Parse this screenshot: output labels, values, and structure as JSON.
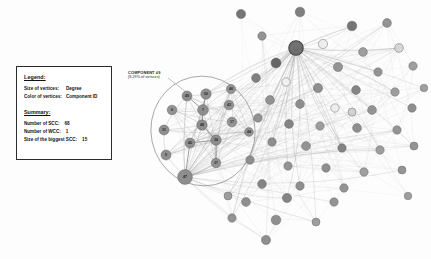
{
  "background": "#fdfdfd",
  "legend": {
    "title": "Legend:",
    "rows": [
      {
        "label": "Size of vertices:",
        "value": "Degree"
      },
      {
        "label": "Color of vertices:",
        "value": "Component ID"
      }
    ],
    "summary_title": "Summary:",
    "summary_rows": [
      {
        "label": "Number of SCC:",
        "value": "68"
      },
      {
        "label": "Number of WCC:",
        "value": "1"
      },
      {
        "label": "Size of the biggest SCC:",
        "value": "15"
      }
    ]
  },
  "annotation": {
    "title": "COMPONENT #9",
    "subtitle": "(8.29% of vertices)"
  },
  "colors": {
    "node_dark": "#6f6f6f",
    "node_mid": "#8f8f8f",
    "node_light": "#d8d8d8",
    "node_white": "#ffffff",
    "node_stroke": "#5a5a5a",
    "hub_stroke": "#3a3a3a",
    "edge": "#b9b9b9",
    "edge_strong": "#8a8a8a",
    "ellipse": "#8a8a8a",
    "leader_line": "#9a9a9a",
    "text": "#111111"
  },
  "chart_data": {
    "type": "scatter",
    "xlabel": "",
    "ylabel": "",
    "highlight_ellipse": {
      "cx": 203,
      "cy": 131,
      "rx": 52,
      "ry": 55,
      "rotation": -12
    },
    "leader_line": {
      "x1": 168,
      "y1": 78,
      "x2": 186,
      "y2": 92
    },
    "labeled_nodes": [
      {
        "id": "49",
        "x": 187,
        "y": 96,
        "r": 5.0,
        "color": "#8a8a8a"
      },
      {
        "id": "50",
        "x": 206,
        "y": 94,
        "r": 5.2,
        "color": "#8a8a8a"
      },
      {
        "id": "46",
        "x": 231,
        "y": 89,
        "r": 4.6,
        "color": "#8f8f8f"
      },
      {
        "id": "6",
        "x": 172,
        "y": 110,
        "r": 4.8,
        "color": "#8f8f8f"
      },
      {
        "id": "7",
        "x": 203,
        "y": 110,
        "r": 5.4,
        "color": "#8a8a8a"
      },
      {
        "id": "43",
        "x": 229,
        "y": 105,
        "r": 4.8,
        "color": "#8f8f8f"
      },
      {
        "id": "48",
        "x": 202,
        "y": 125,
        "r": 5.2,
        "color": "#8a8a8a"
      },
      {
        "id": "17",
        "x": 232,
        "y": 122,
        "r": 4.8,
        "color": "#8f8f8f"
      },
      {
        "id": "31",
        "x": 164,
        "y": 130,
        "r": 5.0,
        "color": "#8a8a8a"
      },
      {
        "id": "44",
        "x": 249,
        "y": 132,
        "r": 4.4,
        "color": "#8f8f8f"
      },
      {
        "id": "40",
        "x": 190,
        "y": 143,
        "r": 5.0,
        "color": "#8a8a8a"
      },
      {
        "id": "34",
        "x": 216,
        "y": 140,
        "r": 5.2,
        "color": "#8a8a8a"
      },
      {
        "id": "5",
        "x": 166,
        "y": 155,
        "r": 5.0,
        "color": "#8a8a8a"
      },
      {
        "id": "37",
        "x": 216,
        "y": 163,
        "r": 4.8,
        "color": "#8f8f8f"
      },
      {
        "id": "47",
        "x": 185,
        "y": 177,
        "r": 7.4,
        "color": "#8a8a8a"
      }
    ],
    "scatter_nodes": [
      {
        "x": 241,
        "y": 14,
        "r": 4.6,
        "color": "#6f6f6f"
      },
      {
        "x": 300,
        "y": 12,
        "r": 4.8,
        "color": "#7a7a7a"
      },
      {
        "x": 352,
        "y": 26,
        "r": 4.8,
        "color": "#6f6f6f"
      },
      {
        "x": 387,
        "y": 23,
        "r": 4.4,
        "color": "#8f8f8f"
      },
      {
        "x": 262,
        "y": 36,
        "r": 4.2,
        "color": "#8f8f8f"
      },
      {
        "x": 296,
        "y": 48,
        "r": 7.2,
        "color": "#6a6a6a"
      },
      {
        "x": 323,
        "y": 44,
        "r": 4.6,
        "color": "#ededed"
      },
      {
        "x": 363,
        "y": 52,
        "r": 4.4,
        "color": "#9a9a9a"
      },
      {
        "x": 399,
        "y": 48,
        "r": 4.4,
        "color": "#d6d6d6"
      },
      {
        "x": 276,
        "y": 63,
        "r": 5.0,
        "color": "#5e5e5e"
      },
      {
        "x": 338,
        "y": 67,
        "r": 4.6,
        "color": "#8f8f8f"
      },
      {
        "x": 378,
        "y": 72,
        "r": 4.2,
        "color": "#8f8f8f"
      },
      {
        "x": 413,
        "y": 66,
        "r": 4.2,
        "color": "#9a9a9a"
      },
      {
        "x": 256,
        "y": 78,
        "r": 4.4,
        "color": "#7a7a7a"
      },
      {
        "x": 286,
        "y": 82,
        "r": 4.2,
        "color": "#f2f2f2"
      },
      {
        "x": 318,
        "y": 88,
        "r": 4.6,
        "color": "#8a8a8a"
      },
      {
        "x": 356,
        "y": 90,
        "r": 4.4,
        "color": "#7f7f7f"
      },
      {
        "x": 395,
        "y": 92,
        "r": 4.2,
        "color": "#9a9a9a"
      },
      {
        "x": 270,
        "y": 100,
        "r": 4.4,
        "color": "#8f8f8f"
      },
      {
        "x": 300,
        "y": 104,
        "r": 4.4,
        "color": "#8a8a8a"
      },
      {
        "x": 335,
        "y": 108,
        "r": 4.2,
        "color": "#ededed"
      },
      {
        "x": 372,
        "y": 110,
        "r": 4.4,
        "color": "#8f8f8f"
      },
      {
        "x": 412,
        "y": 108,
        "r": 4.2,
        "color": "#8a8a8a"
      },
      {
        "x": 258,
        "y": 118,
        "r": 4.2,
        "color": "#8f8f8f"
      },
      {
        "x": 289,
        "y": 124,
        "r": 4.4,
        "color": "#7f7f7f"
      },
      {
        "x": 320,
        "y": 126,
        "r": 4.2,
        "color": "#9a9a9a"
      },
      {
        "x": 357,
        "y": 128,
        "r": 4.4,
        "color": "#8a8a8a"
      },
      {
        "x": 397,
        "y": 130,
        "r": 4.2,
        "color": "#8f8f8f"
      },
      {
        "x": 272,
        "y": 142,
        "r": 4.2,
        "color": "#8a8a8a"
      },
      {
        "x": 306,
        "y": 146,
        "r": 4.4,
        "color": "#8f8f8f"
      },
      {
        "x": 342,
        "y": 148,
        "r": 4.2,
        "color": "#7f7f7f"
      },
      {
        "x": 380,
        "y": 150,
        "r": 4.2,
        "color": "#9a9a9a"
      },
      {
        "x": 414,
        "y": 146,
        "r": 4.0,
        "color": "#8f8f8f"
      },
      {
        "x": 250,
        "y": 160,
        "r": 4.2,
        "color": "#8a8a8a"
      },
      {
        "x": 288,
        "y": 166,
        "r": 4.2,
        "color": "#8f8f8f"
      },
      {
        "x": 326,
        "y": 168,
        "r": 4.2,
        "color": "#8a8a8a"
      },
      {
        "x": 364,
        "y": 172,
        "r": 4.2,
        "color": "#9a9a9a"
      },
      {
        "x": 402,
        "y": 170,
        "r": 4.0,
        "color": "#8f8f8f"
      },
      {
        "x": 262,
        "y": 184,
        "r": 4.4,
        "color": "#7f7f7f"
      },
      {
        "x": 300,
        "y": 186,
        "r": 4.2,
        "color": "#8a8a8a"
      },
      {
        "x": 344,
        "y": 188,
        "r": 4.2,
        "color": "#8f8f8f"
      },
      {
        "x": 246,
        "y": 202,
        "r": 4.4,
        "color": "#8a8a8a"
      },
      {
        "x": 287,
        "y": 198,
        "r": 4.6,
        "color": "#7f7f7f"
      },
      {
        "x": 334,
        "y": 202,
        "r": 4.2,
        "color": "#8f8f8f"
      },
      {
        "x": 232,
        "y": 218,
        "r": 4.2,
        "color": "#8f8f8f"
      },
      {
        "x": 276,
        "y": 220,
        "r": 4.8,
        "color": "#8a8a8a"
      },
      {
        "x": 316,
        "y": 222,
        "r": 4.0,
        "color": "#9a9a9a"
      },
      {
        "x": 266,
        "y": 240,
        "r": 4.6,
        "color": "#8a8a8a"
      },
      {
        "x": 352,
        "y": 112,
        "r": 4.0,
        "color": "#d0d0d0"
      },
      {
        "x": 228,
        "y": 196,
        "r": 4.0,
        "color": "#9a9a9a"
      },
      {
        "x": 424,
        "y": 88,
        "r": 3.8,
        "color": "#9a9a9a"
      },
      {
        "x": 408,
        "y": 196,
        "r": 3.8,
        "color": "#9a9a9a"
      }
    ]
  }
}
